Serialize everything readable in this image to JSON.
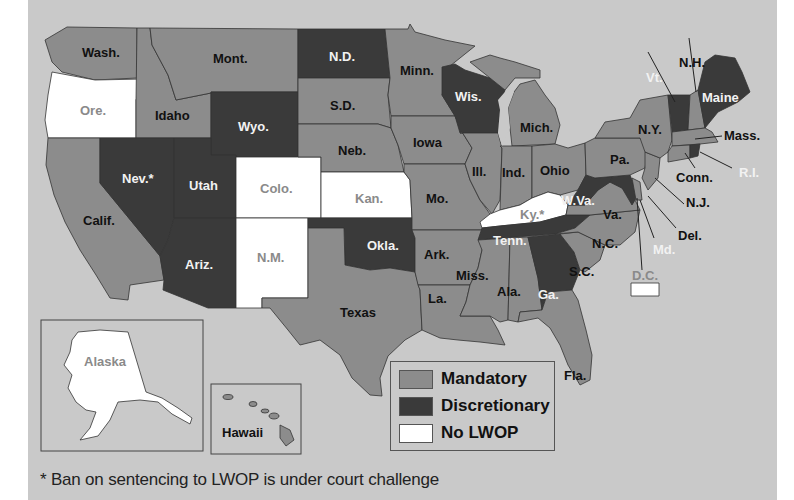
{
  "colors": {
    "background": "#c9c9c9",
    "mandatory": "#8c8c8c",
    "discretionary": "#3a3a3a",
    "no_lwop": "#ffffff"
  },
  "legend": {
    "items": [
      {
        "key": "mandatory",
        "label": "Mandatory"
      },
      {
        "key": "discretionary",
        "label": "Discretionary"
      },
      {
        "key": "no_lwop",
        "label": "No LWOP"
      }
    ]
  },
  "footnote": "* Ban on sentencing to LWOP is under court challenge",
  "states": {
    "wash": {
      "label": "Wash.",
      "category": "mandatory"
    },
    "ore": {
      "label": "Ore.",
      "category": "no_lwop"
    },
    "calif": {
      "label": "Calif.",
      "category": "mandatory"
    },
    "idaho": {
      "label": "Idaho",
      "category": "mandatory"
    },
    "nev": {
      "label": "Nev.*",
      "category": "discretionary"
    },
    "mont": {
      "label": "Mont.",
      "category": "mandatory"
    },
    "wyo": {
      "label": "Wyo.",
      "category": "discretionary"
    },
    "utah": {
      "label": "Utah",
      "category": "discretionary"
    },
    "ariz": {
      "label": "Ariz.",
      "category": "discretionary"
    },
    "colo": {
      "label": "Colo.",
      "category": "no_lwop"
    },
    "nm": {
      "label": "N.M.",
      "category": "no_lwop"
    },
    "nd": {
      "label": "N.D.",
      "category": "discretionary"
    },
    "sd": {
      "label": "S.D.",
      "category": "mandatory"
    },
    "neb": {
      "label": "Neb.",
      "category": "mandatory"
    },
    "kan": {
      "label": "Kan.",
      "category": "no_lwop"
    },
    "okla": {
      "label": "Okla.",
      "category": "discretionary"
    },
    "texas": {
      "label": "Texas",
      "category": "mandatory"
    },
    "minn": {
      "label": "Minn.",
      "category": "mandatory"
    },
    "iowa": {
      "label": "Iowa",
      "category": "mandatory"
    },
    "mo": {
      "label": "Mo.",
      "category": "mandatory"
    },
    "ark": {
      "label": "Ark.",
      "category": "mandatory"
    },
    "la": {
      "label": "La.",
      "category": "mandatory"
    },
    "wis": {
      "label": "Wis.",
      "category": "discretionary"
    },
    "ill": {
      "label": "Ill.",
      "category": "mandatory"
    },
    "mich": {
      "label": "Mich.",
      "category": "mandatory"
    },
    "ind": {
      "label": "Ind.",
      "category": "mandatory"
    },
    "ohio": {
      "label": "Ohio",
      "category": "mandatory"
    },
    "ky": {
      "label": "Ky.*",
      "category": "no_lwop"
    },
    "tenn": {
      "label": "Tenn.",
      "category": "discretionary"
    },
    "miss": {
      "label": "Miss.",
      "category": "mandatory"
    },
    "ala": {
      "label": "Ala.",
      "category": "mandatory"
    },
    "ga": {
      "label": "Ga.",
      "category": "discretionary"
    },
    "fla": {
      "label": "Fla.",
      "category": "mandatory"
    },
    "sc": {
      "label": "S.C.",
      "category": "mandatory"
    },
    "nc": {
      "label": "N.C.",
      "category": "mandatory"
    },
    "va": {
      "label": "Va.",
      "category": "mandatory"
    },
    "wva": {
      "label": "W.Va.",
      "category": "discretionary"
    },
    "md": {
      "label": "Md.",
      "category": "discretionary"
    },
    "del": {
      "label": "Del.",
      "category": "mandatory"
    },
    "dc": {
      "label": "D.C.",
      "category": "no_lwop"
    },
    "pa": {
      "label": "Pa.",
      "category": "mandatory"
    },
    "nj": {
      "label": "N.J.",
      "category": "mandatory"
    },
    "ny": {
      "label": "N.Y.",
      "category": "mandatory"
    },
    "conn": {
      "label": "Conn.",
      "category": "mandatory"
    },
    "ri": {
      "label": "R.I.",
      "category": "discretionary"
    },
    "mass": {
      "label": "Mass.",
      "category": "mandatory"
    },
    "vt": {
      "label": "Vt.",
      "category": "discretionary"
    },
    "nh": {
      "label": "N.H.",
      "category": "mandatory"
    },
    "maine": {
      "label": "Maine",
      "category": "discretionary"
    },
    "alaska": {
      "label": "Alaska",
      "category": "no_lwop"
    },
    "hawaii": {
      "label": "Hawaii",
      "category": "mandatory"
    }
  }
}
